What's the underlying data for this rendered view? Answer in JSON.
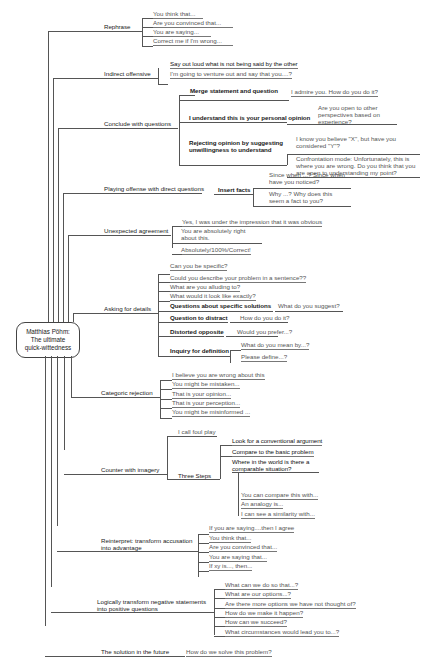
{
  "root": {
    "line1": "Matthias Pöhm:",
    "line2": "The ultimate",
    "line3": "quick-wittedness"
  },
  "branches": [
    {
      "label": "Rephrase",
      "items": [
        "You think that...",
        "Are you convinced that...",
        "You are saying...",
        "Correct me if I'm wrong..."
      ]
    },
    {
      "label": "Indirect offensive",
      "items": [
        "Say out loud what is not being said by the other",
        "I'm going to venture out and say that you....?"
      ]
    },
    {
      "label": "Conclude with  questions",
      "subs": [
        {
          "label": "Merge statement and question",
          "items": [
            "I admire you. How do you do it?"
          ]
        },
        {
          "label": "I understand this is your personal opinion",
          "items": [
            "Are you open to other perspectives based on experience?"
          ]
        },
        {
          "label": "Rejecting opinion by suggesting unwillingness to understand",
          "items": [
            "I know you believe \"X\", but have you considered \"Y\"?",
            "Confrontation mode: Unfortunately, this is where you are wrong. Do you think that you are open to understanding my point?"
          ]
        }
      ]
    },
    {
      "label": "Playing offense with direct questions",
      "subs": [
        {
          "label": "Insert facts",
          "items": [
            "Since when ...? Since when have you noticed?",
            "Why ...? Why does this seem a fact to you?"
          ]
        }
      ]
    },
    {
      "label": "Unexpected agreement",
      "items": [
        "Yes, I was under the impression that it was obvious",
        "You are absolutely right about this.",
        "Absolutely/100%/Correct!"
      ]
    },
    {
      "label": "Asking for details",
      "items": [
        "Can you be specific?",
        "Could you describe your problem in a sentence??",
        "What are you alluding to?",
        "What would it look like exactly?"
      ],
      "subs": [
        {
          "label": "Questions about specific solutions",
          "items": [
            "What do you suggest?"
          ]
        },
        {
          "label": "Question to distract",
          "items": [
            "How do you do it?"
          ]
        },
        {
          "label": "Distorted opposite",
          "items": [
            "Would you prefer...?"
          ]
        },
        {
          "label": "Inquiry for definition",
          "items": [
            "What do you mean by...?",
            "Please define...?"
          ]
        }
      ]
    },
    {
      "label": "Categoric rejection",
      "items": [
        "I believe you are wrong about this",
        "You might be mistaken...",
        "That is your opinion...",
        "That is your perception...",
        "You might be misinformed ..."
      ]
    },
    {
      "label": "Counter with imagery",
      "items": [
        "I call foul play"
      ],
      "subs": [
        {
          "label": "Three Steps",
          "items": [
            "Look for a conventional argument",
            "Compare to the basic problem",
            "Where in the world is there a comparable situation?"
          ],
          "examples": [
            "You can compare this with...",
            "An analogy is...",
            "I can see a similarity with..."
          ]
        }
      ]
    },
    {
      "label": "Reinterpret: transform accusation into advantage",
      "items": [
        "If you are saying....then I agree",
        "You think that...",
        "Are you convinced that...",
        "You are saying that...",
        "If xy is..., then..."
      ]
    },
    {
      "label": "Logically transform negative statements into positive questions",
      "items": [
        "What can we do so that...?",
        "What are our options...?",
        "Are there more options we have not thought of?",
        "How do we make it happen?",
        "How can we succeed?",
        "What circumstances would lead you to...?"
      ]
    },
    {
      "label": "The solution in the future",
      "items": [
        "How do we solve this problem?"
      ]
    }
  ]
}
